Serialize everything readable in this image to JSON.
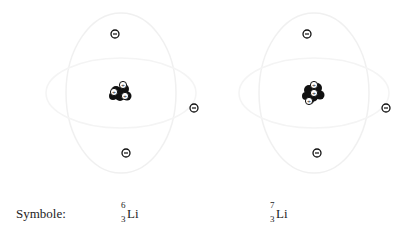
{
  "diagram": {
    "atoms": [
      {
        "name": "lithium-6",
        "nucleus": {
          "x": 121,
          "y": 93,
          "protons": 3
        },
        "electrons": [
          {
            "x": 115,
            "y": 34
          },
          {
            "x": 126,
            "y": 153
          },
          {
            "x": 194,
            "y": 108
          }
        ],
        "symbol": {
          "mass": "6",
          "atomic": "3",
          "element": "Li"
        }
      },
      {
        "name": "lithium-7",
        "nucleus": {
          "x": 314,
          "y": 93,
          "protons": 3
        },
        "electrons": [
          {
            "x": 307,
            "y": 34
          },
          {
            "x": 317,
            "y": 153
          },
          {
            "x": 386,
            "y": 108
          }
        ],
        "symbol": {
          "mass": "7",
          "atomic": "3",
          "element": "Li"
        }
      }
    ],
    "label": "Symbole:",
    "electron_glyph": "−",
    "proton_glyph": "+",
    "colors": {
      "ink": "#222222",
      "orbit": "#f0f0f0"
    }
  }
}
